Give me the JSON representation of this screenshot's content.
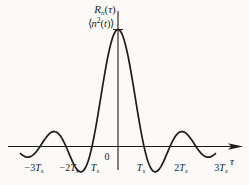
{
  "colors": {
    "ink": "#1c1c1c",
    "background": "#fbfaf8"
  },
  "figure": {
    "y_axis_label": {
      "base": "R",
      "sub": "n",
      "open": "(",
      "var": "τ",
      "close": ")"
    },
    "peak_label": {
      "open": "⟨",
      "base": "n",
      "sup": "2",
      "open2": "(",
      "var": "t",
      "close": ")⟩"
    },
    "origin_label": "0",
    "x_axis_symbol": "τ",
    "x_tick_labels": [
      {
        "num": "−3",
        "sym": "T",
        "sub": "s"
      },
      {
        "num": "−2",
        "sym": "T",
        "sub": "s"
      },
      {
        "num": "",
        "sym": "T",
        "sub": "s"
      },
      {
        "num": "",
        "sym": "T",
        "sub": "s"
      },
      {
        "num": "2",
        "sym": "T",
        "sub": "s"
      },
      {
        "num": "3",
        "sym": "T",
        "sub": "s"
      }
    ]
  },
  "chart_data": {
    "type": "line",
    "function": "R_n(tau) = <n^2(t)> * sinc(tau/T_s)",
    "x_unit": "T_s",
    "peak_value_label": "⟨n²(t)⟩",
    "zero_crossings_units": [
      -3,
      -2,
      -1,
      1,
      2,
      3
    ],
    "x_range_units": [
      -3.75,
      3.75
    ],
    "sample_step_units": 0.05,
    "key_points_units": [
      {
        "x": -3.5,
        "y": -0.091
      },
      {
        "x": -3.0,
        "y": 0
      },
      {
        "x": -2.5,
        "y": 0.127
      },
      {
        "x": -2.0,
        "y": 0
      },
      {
        "x": -1.5,
        "y": -0.212
      },
      {
        "x": -1.0,
        "y": 0
      },
      {
        "x": -0.5,
        "y": 0.637
      },
      {
        "x": 0.0,
        "y": 1.0
      },
      {
        "x": 0.5,
        "y": 0.637
      },
      {
        "x": 1.0,
        "y": 0
      },
      {
        "x": 1.5,
        "y": -0.212
      },
      {
        "x": 2.0,
        "y": 0
      },
      {
        "x": 2.5,
        "y": 0.127
      },
      {
        "x": 3.0,
        "y": 0
      },
      {
        "x": 3.5,
        "y": -0.091
      }
    ],
    "layout": {
      "origin_x": 118,
      "origin_y": 146.5,
      "ts_px": 26,
      "amplitude_px": 117,
      "x_axis_start": 8,
      "x_axis_end": 236,
      "y_axis_top": 11,
      "y_axis_bottom": 170,
      "grid": false,
      "legend": false
    }
  }
}
